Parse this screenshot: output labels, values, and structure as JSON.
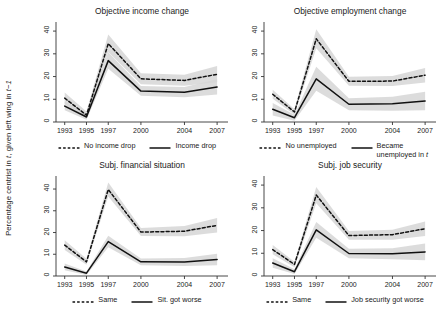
{
  "figure": {
    "ylabel_text": "Percentage centrist in t, given left wing in t−1",
    "ylabel_pre": "Percentage centrist in ",
    "ylabel_it1": "t",
    "ylabel_mid": ", given left wing in ",
    "ylabel_it2": "t−1"
  },
  "chart_data": [
    {
      "type": "line",
      "panel": "top-left",
      "title": "Objective income change",
      "xlabel": "",
      "ylabel": "Percentage centrist in t, given left wing in t−1",
      "x": [
        1993,
        1995,
        1997,
        2000,
        2004,
        2007
      ],
      "xticklabels": [
        "1993",
        "1995",
        "1997",
        "2000",
        "2004",
        "2007"
      ],
      "yticks": [
        0,
        10,
        20,
        30,
        40
      ],
      "ylim": [
        0,
        44
      ],
      "xlim": [
        1992.2,
        2008.0
      ],
      "grid": false,
      "legend_position": "below-axis",
      "series": [
        {
          "name": "No income drop",
          "style": "dashed",
          "color": "#111111",
          "values": [
            10.5,
            3.0,
            34.5,
            19.0,
            18.3,
            21.0
          ],
          "ci_low": [
            8.0,
            1.4,
            30.8,
            16.6,
            16.0,
            17.5
          ],
          "ci_high": [
            13.0,
            4.6,
            38.5,
            21.5,
            20.8,
            24.6
          ]
        },
        {
          "name": "Income drop",
          "style": "solid",
          "color": "#111111",
          "values": [
            7.0,
            2.2,
            27.0,
            13.6,
            13.1,
            15.4
          ],
          "ci_low": [
            5.2,
            1.0,
            23.4,
            11.5,
            10.9,
            12.1
          ],
          "ci_high": [
            8.9,
            3.5,
            30.7,
            15.8,
            15.4,
            18.8
          ]
        }
      ]
    },
    {
      "type": "line",
      "panel": "top-right",
      "title": "Objective employment change",
      "xlabel": "",
      "ylabel": "",
      "x": [
        1993,
        1995,
        1997,
        2000,
        2004,
        2007
      ],
      "xticklabels": [
        "1993",
        "1995",
        "1997",
        "2000",
        "2004",
        "2007"
      ],
      "yticks": [
        0,
        10,
        20,
        30,
        40
      ],
      "ylim": [
        0,
        44
      ],
      "xlim": [
        1992.2,
        2008.0
      ],
      "grid": false,
      "legend_position": "below-axis",
      "series": [
        {
          "name": "No unemployed",
          "style": "dashed",
          "color": "#111111",
          "values": [
            12.2,
            4.4,
            36.6,
            17.9,
            18.0,
            20.6
          ],
          "ci_low": [
            10.2,
            3.2,
            32.4,
            16.0,
            15.8,
            17.4
          ],
          "ci_high": [
            14.2,
            5.6,
            40.8,
            19.9,
            20.2,
            23.8
          ]
        },
        {
          "name": "Became unemployed in t",
          "style": "solid",
          "color": "#111111",
          "values": [
            5.6,
            1.9,
            19.0,
            7.8,
            8.0,
            9.2
          ],
          "ci_low": [
            2.9,
            0.6,
            13.8,
            5.2,
            4.9,
            5.2
          ],
          "ci_high": [
            8.4,
            3.2,
            24.3,
            10.5,
            11.1,
            13.3
          ]
        }
      ]
    },
    {
      "type": "line",
      "panel": "bottom-left",
      "title": "Subj. financial situation",
      "xlabel": "",
      "ylabel": "",
      "x": [
        1993,
        1995,
        1997,
        2000,
        2004,
        2007
      ],
      "xticklabels": [
        "1993",
        "1995",
        "1997",
        "2000",
        "2004",
        "2007"
      ],
      "yticks": [
        0,
        10,
        20,
        30,
        40
      ],
      "ylim": [
        0,
        46
      ],
      "xlim": [
        1992.2,
        2008.0
      ],
      "grid": false,
      "legend_position": "below-axis",
      "series": [
        {
          "name": "Same",
          "style": "dashed",
          "color": "#111111",
          "values": [
            14.2,
            6.5,
            39.8,
            20.2,
            20.6,
            23.3
          ],
          "ci_low": [
            12.0,
            5.2,
            36.6,
            18.4,
            18.3,
            20.0
          ],
          "ci_high": [
            16.4,
            7.9,
            43.0,
            22.1,
            23.0,
            26.7
          ]
        },
        {
          "name": "Sit. got worse",
          "style": "solid",
          "color": "#111111",
          "values": [
            4.1,
            1.3,
            15.8,
            6.5,
            6.4,
            7.6
          ],
          "ci_low": [
            2.6,
            0.5,
            13.2,
            5.0,
            4.6,
            5.0
          ],
          "ci_high": [
            5.7,
            2.1,
            18.5,
            8.1,
            8.3,
            10.2
          ]
        }
      ]
    },
    {
      "type": "line",
      "panel": "bottom-right",
      "title": "Subj. job security",
      "xlabel": "",
      "ylabel": "",
      "x": [
        1993,
        1995,
        1997,
        2000,
        2004,
        2007
      ],
      "xticklabels": [
        "1993",
        "1995",
        "1997",
        "2000",
        "2004",
        "2007"
      ],
      "yticks": [
        0,
        10,
        20,
        30,
        40
      ],
      "ylim": [
        0,
        44
      ],
      "xlim": [
        1992.2,
        2008.0
      ],
      "grid": false,
      "legend_position": "below-axis",
      "series": [
        {
          "name": "Same",
          "style": "dashed",
          "color": "#111111",
          "values": [
            11.6,
            5.1,
            35.6,
            17.8,
            18.2,
            20.8
          ],
          "ci_low": [
            9.6,
            3.9,
            32.0,
            16.0,
            16.0,
            17.6
          ],
          "ci_high": [
            13.6,
            6.3,
            39.2,
            19.8,
            20.4,
            24.0
          ]
        },
        {
          "name": "Job security got worse",
          "style": "solid",
          "color": "#111111",
          "values": [
            5.7,
            1.9,
            20.3,
            9.9,
            9.8,
            10.6
          ],
          "ci_low": [
            3.6,
            0.9,
            16.8,
            7.8,
            7.4,
            6.9
          ],
          "ci_high": [
            7.8,
            3.0,
            23.8,
            12.0,
            12.2,
            14.3
          ]
        }
      ]
    }
  ],
  "style": {
    "band_color": "#d6d6d6",
    "line_color": "#111111",
    "axis_color": "#333333",
    "background": "#ffffff"
  }
}
